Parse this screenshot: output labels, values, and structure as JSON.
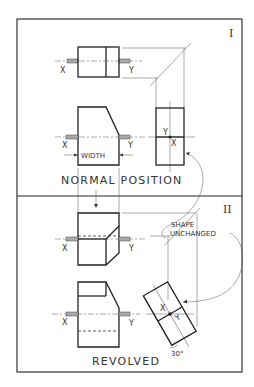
{
  "figure": {
    "type": "engineering-drawing"
  },
  "panel_top": {
    "roman_numeral": "I",
    "caption": "NORMAL POSITION",
    "dimension_label": "WIDTH",
    "axis_labels": {
      "left": "X",
      "right": "Y"
    },
    "side_view_labels": {
      "point_top": "Y",
      "point_bottom": "X"
    }
  },
  "panel_bottom": {
    "roman_numeral": "II",
    "caption": "REVOLVED",
    "note": [
      "SHAPE",
      "UNCHANGED"
    ],
    "angle_label": "30°",
    "axis_labels": {
      "left": "X",
      "right": "Y"
    },
    "side_view_labels": {
      "point_a": "X",
      "point_b": "Y"
    }
  }
}
